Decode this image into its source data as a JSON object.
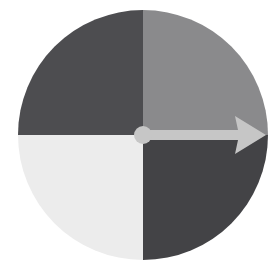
{
  "figure": {
    "name": "quadrant-dial",
    "canvas": {
      "width": 270,
      "height": 270,
      "background_color": "#ffffff"
    }
  },
  "chart_data": {
    "type": "pie",
    "title": "",
    "subtitle": "",
    "xlabel": "",
    "ylabel": "",
    "legend_position": "none",
    "grid": false,
    "center": {
      "x": 143,
      "y": 135
    },
    "radius": 125,
    "labels": [
      "Top-left quadrant",
      "Top-right quadrant",
      "Bottom-right quadrant",
      "Bottom-left quadrant"
    ],
    "values": [
      25,
      25,
      25,
      25
    ],
    "units": "percent",
    "start_angle_deg": 90,
    "direction": "counterclockwise",
    "colors": [
      "#4d4d50",
      "#8a8a8c",
      "#434346",
      "#ececec"
    ],
    "slices": [
      {
        "label": "Top-left quadrant",
        "value": 25,
        "color": "#4d4d50",
        "start_angle_deg": 90,
        "end_angle_deg": 180
      },
      {
        "label": "Top-right quadrant",
        "value": 25,
        "color": "#8a8a8c",
        "start_angle_deg": 0,
        "end_angle_deg": 90
      },
      {
        "label": "Bottom-right quadrant",
        "value": 25,
        "color": "#434346",
        "start_angle_deg": 270,
        "end_angle_deg": 360
      },
      {
        "label": "Bottom-left quadrant",
        "value": 25,
        "color": "#ececec",
        "start_angle_deg": 180,
        "end_angle_deg": 270
      }
    ],
    "annotations": [
      {
        "type": "arrow",
        "name": "pointer-arrow",
        "direction": "right",
        "angle_deg": 0,
        "color": "#c6c6c6",
        "from": {
          "x": 143,
          "y": 135
        },
        "to": {
          "x": 266,
          "y": 135
        },
        "shaft_thickness": 10,
        "head_length": 28,
        "head_width": 38
      },
      {
        "type": "hub",
        "name": "center-hub",
        "color": "#c6c6c6",
        "center": {
          "x": 143,
          "y": 135
        },
        "radius": 9
      }
    ]
  },
  "palette": {
    "background": "#ffffff",
    "quadrant_top_left": "#4d4d50",
    "quadrant_top_right": "#8a8a8c",
    "quadrant_bottom_left": "#ececec",
    "quadrant_bottom_right": "#434346",
    "pointer": "#c6c6c6",
    "hub": "#c6c6c6"
  }
}
